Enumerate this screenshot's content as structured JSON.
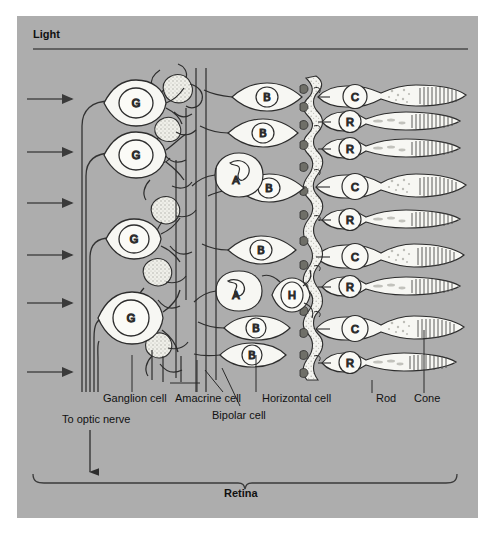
{
  "figure": {
    "background_color": "#adadad",
    "page_color": "#ffffff",
    "ink_color": "#222222",
    "cell_fill": "#f7f7f3",
    "stipple_color": "#d8d8d2"
  },
  "headings": {
    "light": "Light",
    "retina": "Retina"
  },
  "labels": {
    "optic_nerve": "To optic nerve",
    "ganglion": "Ganglion cell",
    "amacrine": "Amacrine cell",
    "bipolar": "Bipolar cell",
    "horizontal": "Horizontal cell",
    "rod": "Rod",
    "cone": "Cone"
  },
  "cell_letters": {
    "ganglion": "G",
    "amacrine": "A",
    "bipolar": "B",
    "horizontal": "H",
    "rod": "R",
    "cone": "C"
  },
  "cells": {
    "ganglion": [
      {
        "label": "G",
        "x": 133,
        "y": 103,
        "rx": 30,
        "ry": 22,
        "nrx": 17,
        "nry": 15
      },
      {
        "label": "G",
        "x": 133,
        "y": 155,
        "rx": 30,
        "ry": 22,
        "nrx": 17,
        "nry": 15
      },
      {
        "label": "G",
        "x": 131,
        "y": 239,
        "rx": 26,
        "ry": 20,
        "nrx": 15,
        "nry": 14
      },
      {
        "label": "G",
        "x": 128,
        "y": 318,
        "rx": 31,
        "ry": 25,
        "nrx": 18,
        "nry": 18
      }
    ],
    "amacrine": [
      {
        "label": "A",
        "x": 239,
        "y": 175,
        "rx": 24,
        "ry": 21,
        "nrx": 13,
        "nry": 15
      },
      {
        "label": "A",
        "x": 239,
        "y": 291,
        "rx": 23,
        "ry": 20,
        "nrx": 13,
        "nry": 13
      }
    ],
    "bipolar": [
      {
        "label": "B",
        "x": 267,
        "y": 97,
        "rx": 17,
        "ry": 15,
        "nrx": 11,
        "nry": 10
      },
      {
        "label": "B",
        "x": 263,
        "y": 133,
        "rx": 17,
        "ry": 15,
        "nrx": 11,
        "nry": 10
      },
      {
        "label": "B",
        "x": 269,
        "y": 188,
        "rx": 17,
        "ry": 15,
        "nrx": 11,
        "nry": 10
      },
      {
        "label": "B",
        "x": 261,
        "y": 250,
        "rx": 17,
        "ry": 15,
        "nrx": 11,
        "nry": 10
      },
      {
        "label": "B",
        "x": 256,
        "y": 328,
        "rx": 16,
        "ry": 14,
        "nrx": 10,
        "nry": 10
      },
      {
        "label": "B",
        "x": 252,
        "y": 355,
        "rx": 16,
        "ry": 14,
        "nrx": 10,
        "nry": 10
      }
    ],
    "horizontal": [
      {
        "label": "H",
        "x": 292,
        "y": 295,
        "rx": 18,
        "ry": 19,
        "nrx": 11,
        "nry": 13
      }
    ],
    "photoreceptors": [
      {
        "label": "C",
        "y": 97,
        "type": "cone"
      },
      {
        "label": "R",
        "y": 122,
        "type": "rod"
      },
      {
        "label": "R",
        "y": 149,
        "type": "rod"
      },
      {
        "label": "C",
        "y": 187,
        "type": "cone"
      },
      {
        "label": "R",
        "y": 220,
        "type": "rod"
      },
      {
        "label": "C",
        "y": 257,
        "type": "cone"
      },
      {
        "label": "R",
        "y": 287,
        "type": "rod"
      },
      {
        "label": "C",
        "y": 329,
        "type": "cone"
      },
      {
        "label": "R",
        "y": 363,
        "type": "rod"
      }
    ]
  },
  "light_arrows": {
    "count": 6,
    "x_start": 27,
    "x_end": 75,
    "y_positions": [
      99,
      152,
      203,
      255,
      303,
      372
    ]
  },
  "light_rule": {
    "x1": 33,
    "y1": 49,
    "x2": 468,
    "y2": 49
  },
  "optic_nerve": {
    "fiber_count": 5,
    "arrow_x": 90,
    "arrow_y1": 415,
    "arrow_y2": 477
  },
  "retina_brace": {
    "x1": 33,
    "x2": 455,
    "y": 485,
    "tip_x": 244
  }
}
